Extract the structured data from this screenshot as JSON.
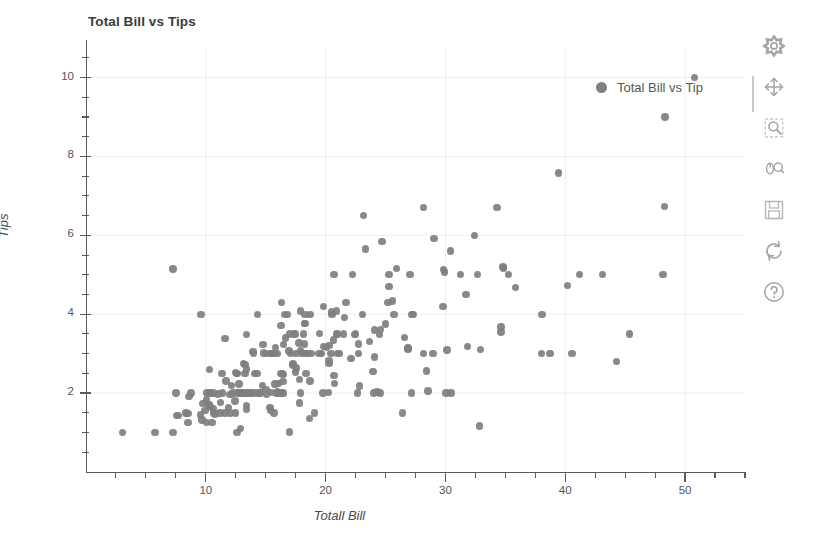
{
  "chart_data": {
    "type": "scatter",
    "title": "Total Bill vs Tips",
    "xlabel": "Totall Bill",
    "ylabel": "Tips",
    "xlim": [
      0,
      55
    ],
    "ylim": [
      0,
      10.8
    ],
    "grid": true,
    "legend": {
      "position": "top-right",
      "entries": [
        {
          "name": "Total Bill vs Tip",
          "color": "#7f7f7f",
          "marker": "circle"
        }
      ]
    },
    "xticks": [
      10,
      20,
      30,
      40,
      50
    ],
    "yticks": [
      2,
      4,
      6,
      8,
      10
    ],
    "marker_color": "#7f7f7f",
    "marker_size": 7,
    "series": [
      {
        "name": "Total Bill vs Tip",
        "x": [
          16.99,
          10.34,
          21.01,
          23.68,
          24.59,
          25.29,
          8.77,
          26.88,
          15.04,
          14.78,
          10.27,
          35.26,
          15.42,
          18.43,
          14.83,
          21.58,
          10.33,
          16.29,
          16.97,
          20.65,
          17.92,
          20.29,
          15.77,
          39.42,
          19.82,
          17.81,
          13.37,
          12.69,
          21.7,
          19.65,
          9.55,
          18.35,
          15.06,
          20.69,
          17.78,
          24.06,
          16.31,
          16.93,
          18.69,
          31.27,
          16.04,
          17.46,
          13.94,
          9.68,
          30.4,
          18.29,
          22.23,
          32.4,
          28.55,
          18.04,
          12.54,
          10.29,
          34.81,
          9.94,
          25.56,
          19.49,
          38.01,
          26.41,
          11.24,
          48.27,
          20.29,
          13.81,
          11.02,
          18.29,
          17.59,
          20.08,
          16.45,
          3.07,
          20.23,
          15.01,
          12.02,
          17.07,
          26.86,
          25.28,
          14.73,
          10.51,
          17.92,
          27.2,
          22.76,
          17.29,
          19.44,
          16.66,
          10.07,
          32.68,
          15.98,
          34.83,
          13.03,
          18.28,
          24.71,
          21.16,
          28.97,
          22.49,
          5.75,
          16.32,
          22.75,
          40.17,
          27.28,
          12.03,
          21.01,
          12.46,
          11.35,
          15.38,
          44.3,
          22.42,
          20.92,
          15.36,
          20.49,
          25.21,
          18.24,
          14.31,
          14.0,
          7.25,
          38.07,
          23.95,
          25.71,
          17.31,
          29.93,
          10.65,
          12.43,
          24.08,
          11.69,
          13.42,
          14.26,
          15.95,
          12.48,
          29.8,
          8.52,
          14.52,
          11.38,
          22.82,
          19.08,
          20.27,
          11.17,
          12.26,
          18.26,
          8.51,
          10.33,
          14.15,
          16.0,
          13.16,
          17.47,
          34.3,
          41.19,
          27.05,
          16.43,
          8.35,
          18.64,
          11.87,
          9.78,
          7.51,
          14.07,
          13.13,
          17.26,
          24.55,
          19.77,
          29.85,
          48.17,
          25.0,
          13.39,
          16.49,
          21.5,
          12.66,
          16.21,
          13.81,
          17.51,
          24.52,
          20.76,
          31.71,
          10.59,
          10.63,
          50.81,
          15.81,
          7.25,
          31.85,
          16.82,
          32.9,
          17.89,
          14.48,
          9.6,
          34.63,
          34.65,
          23.33,
          45.35,
          23.17,
          40.55,
          20.69,
          20.9,
          30.46,
          18.15,
          23.1,
          15.69,
          19.81,
          28.44,
          15.48,
          16.58,
          7.56,
          10.34,
          43.11,
          13.0,
          13.51,
          18.71,
          12.74,
          13.0,
          16.4,
          20.53,
          16.47,
          26.59,
          38.73,
          24.27,
          12.76,
          30.06,
          25.89,
          48.33,
          13.27,
          28.17,
          12.9,
          28.15,
          11.59,
          7.74,
          30.14,
          12.16,
          13.42,
          8.58,
          15.98,
          13.42,
          16.27,
          10.09,
          20.45,
          13.28,
          22.12,
          24.01,
          15.69,
          11.61,
          10.77,
          15.53,
          10.07,
          12.6,
          32.83,
          35.83,
          29.03,
          27.18,
          22.67,
          17.82,
          18.78
        ],
        "y": [
          1.01,
          1.66,
          3.5,
          3.31,
          3.61,
          4.71,
          2.0,
          3.12,
          1.96,
          3.23,
          1.71,
          5.0,
          1.57,
          3.0,
          3.02,
          3.92,
          1.67,
          3.71,
          3.5,
          3.35,
          4.08,
          2.75,
          2.23,
          7.58,
          3.18,
          2.34,
          2.0,
          2.0,
          4.3,
          3.0,
          1.45,
          2.5,
          3.0,
          2.45,
          3.27,
          3.6,
          2.0,
          3.07,
          2.31,
          5.0,
          2.24,
          2.54,
          3.06,
          1.32,
          5.6,
          3.0,
          5.0,
          6.0,
          2.05,
          3.0,
          2.5,
          2.6,
          5.2,
          1.56,
          4.34,
          3.51,
          3.0,
          1.5,
          1.76,
          6.73,
          3.21,
          2.0,
          1.98,
          3.76,
          2.64,
          3.15,
          2.47,
          1.0,
          2.01,
          2.09,
          1.97,
          3.0,
          3.14,
          5.0,
          2.2,
          1.25,
          3.08,
          4.0,
          3.0,
          2.71,
          3.0,
          3.4,
          1.83,
          5.0,
          2.03,
          5.17,
          2.0,
          4.0,
          5.85,
          3.0,
          3.0,
          3.5,
          1.0,
          4.3,
          3.25,
          4.73,
          4.0,
          1.5,
          3.0,
          1.5,
          2.5,
          3.0,
          2.8,
          3.48,
          4.08,
          1.64,
          4.06,
          4.29,
          3.76,
          4.0,
          3.0,
          1.0,
          4.0,
          2.55,
          4.0,
          3.5,
          5.07,
          1.5,
          1.8,
          2.92,
          2.31,
          1.68,
          2.5,
          2.0,
          2.52,
          4.2,
          1.48,
          2.0,
          2.0,
          2.18,
          1.5,
          2.83,
          1.5,
          2.0,
          3.25,
          1.25,
          2.0,
          2.0,
          2.0,
          2.75,
          3.5,
          6.7,
          5.0,
          5.0,
          2.3,
          1.5,
          1.36,
          1.63,
          1.73,
          2.0,
          2.5,
          2.0,
          2.74,
          2.0,
          2.0,
          5.14,
          5.0,
          3.75,
          2.61,
          2.0,
          3.5,
          2.5,
          2.0,
          2.0,
          3.0,
          3.48,
          2.24,
          4.5,
          1.61,
          2.0,
          10.0,
          3.16,
          5.15,
          3.18,
          4.0,
          3.11,
          2.0,
          2.0,
          4.0,
          3.55,
          3.68,
          5.65,
          3.5,
          6.5,
          3.0,
          5.0,
          3.5,
          2.0,
          3.5,
          4.0,
          1.5,
          4.19,
          2.56,
          2.02,
          4.0,
          1.44,
          2.0,
          5.0,
          2.0,
          2.0,
          4.0,
          2.0,
          2.0,
          2.5,
          4.0,
          3.23,
          3.41,
          3.0,
          2.03,
          2.23,
          2.0,
          5.16,
          9.0,
          2.5,
          6.7,
          1.1,
          3.0,
          1.5,
          1.44,
          3.09,
          2.2,
          3.48,
          1.92,
          3.0,
          1.58,
          2.5,
          2.0,
          3.0,
          2.72,
          2.88,
          2.0,
          3.0,
          3.39,
          1.47,
          3.0,
          1.25,
          1.0,
          1.17,
          4.67,
          5.92,
          2.0,
          2.0,
          1.75,
          3.0
        ]
      }
    ]
  },
  "legend": {
    "label": "Total Bill vs Tip"
  },
  "axes": {
    "x_title": "Totall Bill",
    "y_title": "Tips",
    "x_tick_labels": [
      "10",
      "20",
      "30",
      "40",
      "50"
    ],
    "y_tick_labels": [
      "2",
      "4",
      "6",
      "8",
      "10"
    ]
  },
  "toolbar": {
    "items": [
      {
        "name": "bokeh-logo-icon",
        "label": "Bokeh"
      },
      {
        "name": "pan-tool-icon",
        "label": "Pan"
      },
      {
        "name": "box-zoom-tool-icon",
        "label": "Box Zoom"
      },
      {
        "name": "wheel-zoom-tool-icon",
        "label": "Wheel Zoom"
      },
      {
        "name": "save-tool-icon",
        "label": "Save"
      },
      {
        "name": "reset-tool-icon",
        "label": "Reset"
      },
      {
        "name": "help-tool-icon",
        "label": "Help"
      }
    ]
  },
  "colors": {
    "marker": "#7f7f7f",
    "axis": "#5a5a5a",
    "grid": "#eeeeee",
    "text": "#555555",
    "background": "#ffffff"
  }
}
